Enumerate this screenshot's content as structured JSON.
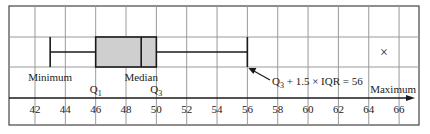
{
  "chart_data": {
    "type": "boxplot",
    "title": "",
    "xlabel": "",
    "ylabel": "",
    "xlim": [
      40.8,
      67.5
    ],
    "x_ticks": [
      42,
      44,
      46,
      48,
      50,
      52,
      54,
      56,
      58,
      60,
      62,
      64,
      66
    ],
    "x_tick_labels": [
      "42",
      "44",
      "46",
      "48",
      "50",
      "52",
      "54",
      "56",
      "58",
      "60",
      "62",
      "64",
      "66"
    ],
    "grid": true,
    "box": {
      "minimum_whisker": 43,
      "q1": 46,
      "median": 49,
      "q3": 50,
      "upper_whisker": 56
    },
    "outliers": [
      65
    ],
    "labels": {
      "minimum": "Minimum",
      "q1": "Q",
      "q1_sub": "1",
      "median": "Median",
      "q3": "Q",
      "q3_sub": "3",
      "maximum": "Maximum",
      "annotation_prefix": "Q",
      "annotation_sub": "3",
      "annotation_suffix": " + 1.5 × IQR = 56"
    },
    "outlier_marker": "×",
    "colors": {
      "box_fill": "#cfcfcf",
      "line": "#1a1a1a",
      "grid": "#9a9a9a"
    }
  }
}
